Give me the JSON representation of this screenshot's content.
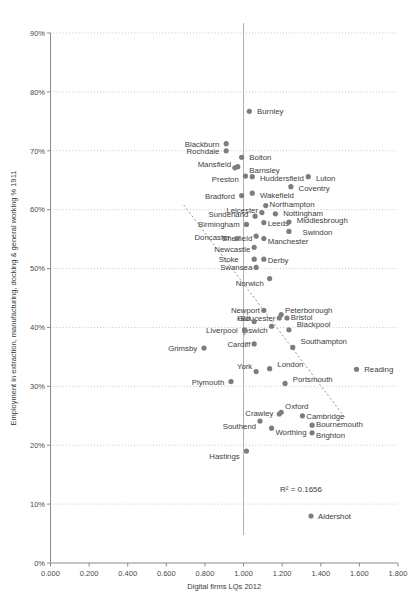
{
  "chart_data": {
    "type": "scatter",
    "title": "",
    "xlabel": "Digital firms LQs 2012",
    "ylabel": "Employment in extraction, manufacturing, docking & general working % 1911",
    "xlim": [
      0.0,
      1.8
    ],
    "ylim": [
      0.0,
      0.9
    ],
    "xticks": [
      "0.000",
      "0.200",
      "0.400",
      "0.600",
      "0.800",
      "1.000",
      "1.200",
      "1.400",
      "1.600",
      "1.800"
    ],
    "xtick_values": [
      0.0,
      0.2,
      0.4,
      0.6,
      0.8,
      1.0,
      1.2,
      1.4,
      1.6,
      1.8
    ],
    "yticks": [
      "0%",
      "10%",
      "20%",
      "30%",
      "40%",
      "50%",
      "60%",
      "70%",
      "80%",
      "90%"
    ],
    "ytick_values": [
      0,
      10,
      20,
      30,
      40,
      50,
      60,
      70,
      80,
      90
    ],
    "grid": "horizontal-dotted",
    "legend": "none",
    "reference_line_x": 1.0,
    "trendline": {
      "style": "dotted",
      "x0": 0.69,
      "y0": 60.8,
      "x1": 1.53,
      "y1": 24.5
    },
    "annotation": "R² = 0.1656",
    "annotation_marker": "Aldershot",
    "points": [
      {
        "label": "Burnley",
        "x": 1.03,
        "y": 76.7,
        "lx": 1.07,
        "ly": 76.7,
        "anchor": "start"
      },
      {
        "label": "Blackburn",
        "x": 0.91,
        "y": 71.2,
        "lx": 0.875,
        "ly": 71.2,
        "anchor": "end"
      },
      {
        "label": "Rochdale",
        "x": 0.91,
        "y": 70.0,
        "lx": 0.875,
        "ly": 70.0,
        "anchor": "end"
      },
      {
        "label": "Bolton",
        "x": 0.99,
        "y": 68.9,
        "lx": 1.03,
        "ly": 68.9,
        "anchor": "start"
      },
      {
        "label": "Mansfield",
        "x": 0.97,
        "y": 67.3,
        "lx": 0.935,
        "ly": 67.8,
        "anchor": "end"
      },
      {
        "label": "Barnsley",
        "x": 0.955,
        "y": 67.1,
        "lx": 1.03,
        "ly": 66.8,
        "anchor": "start"
      },
      {
        "label": "Preston",
        "x": 1.01,
        "y": 65.7,
        "lx": 0.975,
        "ly": 65.2,
        "anchor": "end"
      },
      {
        "label": "Huddersfield",
        "x": 1.045,
        "y": 65.6,
        "lx": 1.085,
        "ly": 65.3,
        "anchor": "start"
      },
      {
        "label": "Luton",
        "x": 1.335,
        "y": 65.6,
        "lx": 1.375,
        "ly": 65.3,
        "anchor": "start"
      },
      {
        "label": "Coventry",
        "x": 1.245,
        "y": 63.9,
        "lx": 1.285,
        "ly": 63.6,
        "anchor": "start"
      },
      {
        "label": "Bradford",
        "x": 0.99,
        "y": 62.4,
        "lx": 0.955,
        "ly": 62.3,
        "anchor": "end"
      },
      {
        "label": "Wakefield",
        "x": 1.045,
        "y": 62.8,
        "lx": 1.085,
        "ly": 62.4,
        "anchor": "start"
      },
      {
        "label": "Northampton",
        "x": 1.115,
        "y": 60.7,
        "lx": 1.135,
        "ly": 61.0,
        "anchor": "start"
      },
      {
        "label": "Leicester",
        "x": 1.095,
        "y": 59.5,
        "lx": 1.075,
        "ly": 60.0,
        "anchor": "end"
      },
      {
        "label": "Nottingham",
        "x": 1.165,
        "y": 59.3,
        "lx": 1.205,
        "ly": 59.4,
        "anchor": "start"
      },
      {
        "label": "Sunderland",
        "x": 1.06,
        "y": 58.9,
        "lx": 1.025,
        "ly": 59.2,
        "anchor": "end"
      },
      {
        "label": "Birmingham",
        "x": 1.015,
        "y": 57.5,
        "lx": 0.98,
        "ly": 57.6,
        "anchor": "end"
      },
      {
        "label": "Leeds",
        "x": 1.105,
        "y": 57.8,
        "lx": 1.125,
        "ly": 57.7,
        "anchor": "start"
      },
      {
        "label": "Middlesbrough",
        "x": 1.235,
        "y": 57.9,
        "lx": 1.275,
        "ly": 58.2,
        "anchor": "start"
      },
      {
        "label": "Swindon",
        "x": 1.235,
        "y": 56.3,
        "lx": 1.305,
        "ly": 56.2,
        "anchor": "start"
      },
      {
        "label": "Sheffield",
        "x": 1.065,
        "y": 55.5,
        "lx": 1.045,
        "ly": 55.2,
        "anchor": "end"
      },
      {
        "label": "Doncaster",
        "x": 0.965,
        "y": 55.1,
        "lx": 0.93,
        "ly": 55.3,
        "anchor": "end"
      },
      {
        "label": "Manchester",
        "x": 1.105,
        "y": 55.1,
        "lx": 1.125,
        "ly": 54.6,
        "anchor": "start"
      },
      {
        "label": "Newcastle",
        "x": 1.055,
        "y": 53.6,
        "lx": 1.035,
        "ly": 53.3,
        "anchor": "end"
      },
      {
        "label": "Stoke",
        "x": 1.055,
        "y": 51.6,
        "lx": 0.975,
        "ly": 51.6,
        "anchor": "end"
      },
      {
        "label": "Derby",
        "x": 1.105,
        "y": 51.6,
        "lx": 1.125,
        "ly": 51.4,
        "anchor": "start"
      },
      {
        "label": "Swansea",
        "x": 1.065,
        "y": 50.2,
        "lx": 1.045,
        "ly": 50.2,
        "anchor": "end"
      },
      {
        "label": "Norwich",
        "x": 1.135,
        "y": 48.3,
        "lx": 1.105,
        "ly": 47.6,
        "anchor": "end"
      },
      {
        "label": "Newport",
        "x": 1.105,
        "y": 42.9,
        "lx": 1.085,
        "ly": 42.9,
        "anchor": "end"
      },
      {
        "label": "Peterborough",
        "x": 1.195,
        "y": 42.2,
        "lx": 1.215,
        "ly": 43.0,
        "anchor": "start"
      },
      {
        "label": "Bristol",
        "x": 1.225,
        "y": 41.6,
        "lx": 1.245,
        "ly": 41.7,
        "anchor": "start"
      },
      {
        "label": "Gloucester",
        "x": 1.185,
        "y": 41.6,
        "lx": 1.165,
        "ly": 41.6,
        "anchor": "end"
      },
      {
        "label": "Hull",
        "x": 1.055,
        "y": 41.0,
        "lx": 1.035,
        "ly": 41.6,
        "anchor": "end"
      },
      {
        "label": "Blackpool",
        "x": 1.235,
        "y": 39.6,
        "lx": 1.275,
        "ly": 40.6,
        "anchor": "start"
      },
      {
        "label": "Ipswich",
        "x": 1.145,
        "y": 40.2,
        "lx": 1.125,
        "ly": 39.6,
        "anchor": "end"
      },
      {
        "label": "Liverpool",
        "x": 1.005,
        "y": 39.6,
        "lx": 0.97,
        "ly": 39.6,
        "anchor": "end"
      },
      {
        "label": "Cardiff",
        "x": 1.055,
        "y": 37.2,
        "lx": 1.035,
        "ly": 37.2,
        "anchor": "end"
      },
      {
        "label": "Southampton",
        "x": 1.255,
        "y": 36.6,
        "lx": 1.295,
        "ly": 37.6,
        "anchor": "start"
      },
      {
        "label": "Grimsby",
        "x": 0.795,
        "y": 36.5,
        "lx": 0.76,
        "ly": 36.5,
        "anchor": "end"
      },
      {
        "label": "London",
        "x": 1.135,
        "y": 33.0,
        "lx": 1.175,
        "ly": 33.7,
        "anchor": "start"
      },
      {
        "label": "York",
        "x": 1.065,
        "y": 32.5,
        "lx": 1.045,
        "ly": 33.4,
        "anchor": "end"
      },
      {
        "label": "Reading",
        "x": 1.585,
        "y": 32.9,
        "lx": 1.625,
        "ly": 32.9,
        "anchor": "start"
      },
      {
        "label": "Portsmouth",
        "x": 1.215,
        "y": 30.5,
        "lx": 1.255,
        "ly": 31.3,
        "anchor": "start"
      },
      {
        "label": "Plymouth",
        "x": 0.935,
        "y": 30.8,
        "lx": 0.9,
        "ly": 30.8,
        "anchor": "end"
      },
      {
        "label": "Oxford",
        "x": 1.195,
        "y": 25.6,
        "lx": 1.215,
        "ly": 26.7,
        "anchor": "start"
      },
      {
        "label": "Crawley",
        "x": 1.185,
        "y": 25.3,
        "lx": 1.155,
        "ly": 25.4,
        "anchor": "end"
      },
      {
        "label": "Cambridge",
        "x": 1.305,
        "y": 25.0,
        "lx": 1.325,
        "ly": 25.0,
        "anchor": "start"
      },
      {
        "label": "Southend",
        "x": 1.085,
        "y": 24.1,
        "lx": 1.065,
        "ly": 23.2,
        "anchor": "end"
      },
      {
        "label": "Bournemouth",
        "x": 1.355,
        "y": 23.4,
        "lx": 1.375,
        "ly": 23.6,
        "anchor": "start"
      },
      {
        "label": "Worthing",
        "x": 1.145,
        "y": 22.9,
        "lx": 1.165,
        "ly": 22.2,
        "anchor": "start"
      },
      {
        "label": "Brighton",
        "x": 1.355,
        "y": 22.1,
        "lx": 1.375,
        "ly": 21.7,
        "anchor": "start"
      },
      {
        "label": "Hastings",
        "x": 1.015,
        "y": 19.0,
        "lx": 0.98,
        "ly": 18.2,
        "anchor": "end"
      }
    ]
  }
}
